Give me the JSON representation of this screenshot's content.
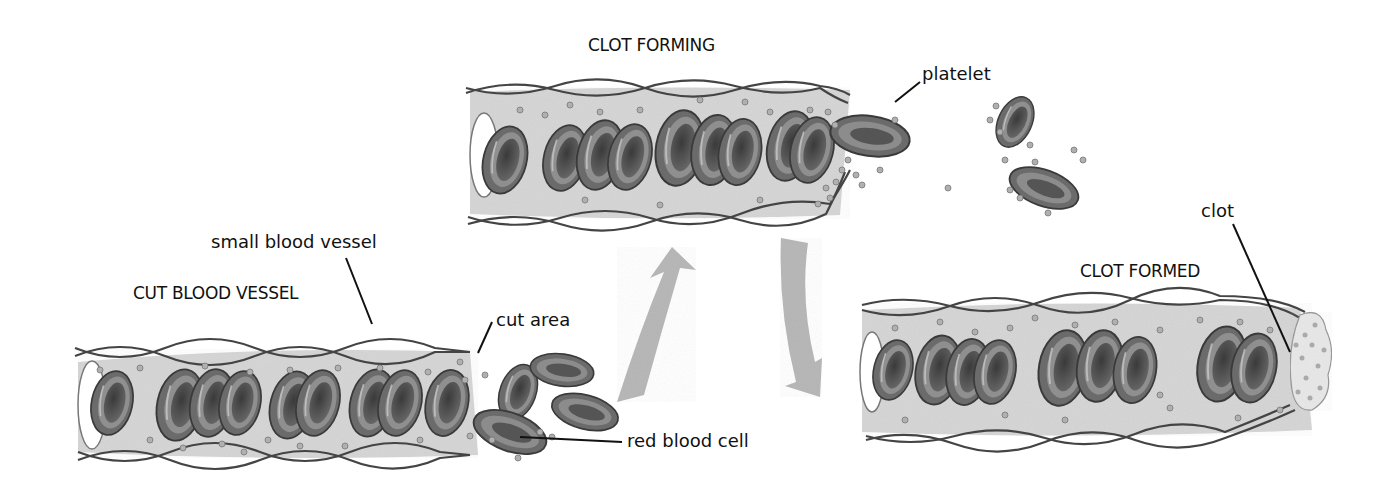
{
  "diagram": {
    "colors": {
      "background": "#ffffff",
      "plasma": "#d9d9d9",
      "vessel_wall": "#4a4a4a",
      "cell_fill": "#6e6e6e",
      "cell_rim": "#9a9a9a",
      "cell_center": "#3c3c3c",
      "platelet": "#a8a8a8",
      "arrow": "#b8b8b8",
      "text": "#111111",
      "clot": "#e6e6e6"
    },
    "stages": [
      {
        "id": "cut",
        "title": "CUT BLOOD VESSEL"
      },
      {
        "id": "forming",
        "title": "CLOT FORMING"
      },
      {
        "id": "formed",
        "title": "CLOT FORMED"
      }
    ],
    "callouts": {
      "small_blood_vessel": "small blood vessel",
      "cut_area": "cut area",
      "red_blood_cell": "red blood cell",
      "platelet": "platelet",
      "clot": "clot"
    },
    "arrows": [
      {
        "from": "cut",
        "to": "forming",
        "direction": "up"
      },
      {
        "from": "forming",
        "to": "formed",
        "direction": "down"
      }
    ]
  }
}
